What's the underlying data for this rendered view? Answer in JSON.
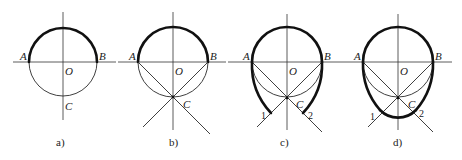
{
  "figures": [
    {
      "id": "a",
      "caption": "a)",
      "labels": {
        "A": "A",
        "B": "B",
        "O": "O",
        "C": "C"
      }
    },
    {
      "id": "b",
      "caption": "b)",
      "labels": {
        "A": "A",
        "B": "B",
        "O": "O",
        "C": "C"
      }
    },
    {
      "id": "c",
      "caption": "c)",
      "labels": {
        "A": "A",
        "B": "B",
        "O": "O",
        "C": "C",
        "p1": "1",
        "p2": "2"
      }
    },
    {
      "id": "d",
      "caption": "d)",
      "labels": {
        "A": "A",
        "B": "B",
        "O": "O",
        "C": "C",
        "p1": "1",
        "p2": "2"
      }
    }
  ],
  "colors": {
    "line": "#2a2a2a",
    "thick": "#111111",
    "background": "#ffffff"
  }
}
